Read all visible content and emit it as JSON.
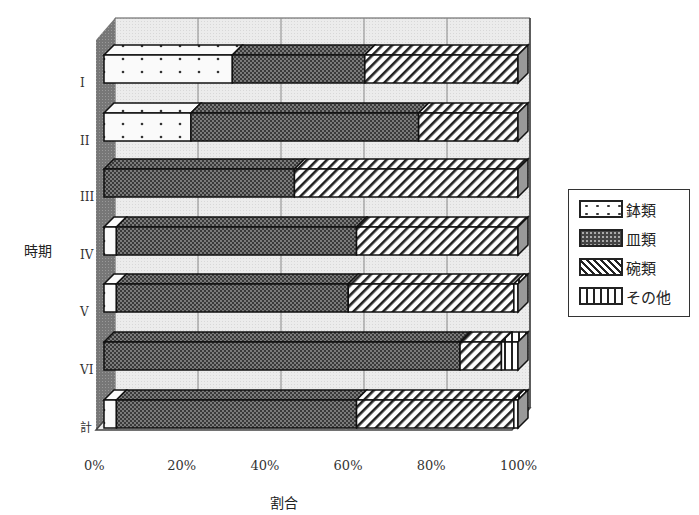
{
  "chart_data": {
    "type": "bar",
    "orientation": "horizontal",
    "stacked": true,
    "percent": true,
    "style": "3d",
    "title": "",
    "xlabel": "割合",
    "ylabel": "時期",
    "xlim": [
      0,
      100
    ],
    "x_ticks": [
      "0%",
      "20%",
      "40%",
      "60%",
      "80%",
      "100%"
    ],
    "grid": true,
    "legend_position": "right",
    "categories": [
      "I",
      "II",
      "III",
      "IV",
      "V",
      "VI",
      "計"
    ],
    "series": [
      {
        "name": "鉢類",
        "pattern": "dots",
        "values": [
          31,
          21,
          0,
          3,
          3,
          0,
          3
        ]
      },
      {
        "name": "皿類",
        "pattern": "dense-check",
        "values": [
          32,
          55,
          46,
          58,
          56,
          86,
          58
        ]
      },
      {
        "name": "碗類",
        "pattern": "diagonal",
        "values": [
          37,
          24,
          54,
          39,
          40,
          10,
          38
        ]
      },
      {
        "name": "その他",
        "pattern": "vertical",
        "values": [
          0,
          0,
          0,
          0,
          1,
          4,
          1
        ]
      }
    ]
  },
  "labels": {
    "ylabel": "時期",
    "xlabel": "割合",
    "ticks": [
      "0%",
      "20%",
      "40%",
      "60%",
      "80%",
      "100%"
    ],
    "categories": [
      "I",
      "II",
      "III",
      "IV",
      "V",
      "VI",
      "計"
    ]
  },
  "legend": {
    "items": [
      {
        "label": "鉢類"
      },
      {
        "label": "皿類"
      },
      {
        "label": "碗類"
      },
      {
        "label": "その他"
      }
    ]
  }
}
